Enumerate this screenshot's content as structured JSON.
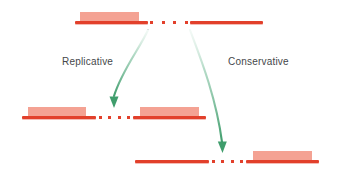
{
  "figure": {
    "colors": {
      "strand": "#e2402b",
      "transposon": "#f4a293",
      "arrow": "#3f9d6c",
      "arrow_fade": "#cfe8db",
      "label_text": "#45474a",
      "background": "#ffffff"
    },
    "labels": {
      "replicative": "Replicative",
      "conservative": "Conservative"
    },
    "rows": [
      {
        "id": "donor",
        "name": "donor-molecule",
        "segments": [
          {
            "kind": "line",
            "x": 75,
            "width": 73,
            "has_transposon": true,
            "transposon_x": 80,
            "transposon_width": 59
          },
          {
            "kind": "dots",
            "x": 150,
            "width": 38,
            "count": 4
          },
          {
            "kind": "line",
            "x": 190,
            "width": 73,
            "has_transposon": false
          }
        ],
        "y": 21
      },
      {
        "id": "replicative-product",
        "name": "replicative-product-molecule",
        "segments": [
          {
            "kind": "line",
            "x": 22,
            "width": 74,
            "has_transposon": true,
            "transposon_x": 28,
            "transposon_width": 58
          },
          {
            "kind": "dots",
            "x": 99,
            "width": 31,
            "count": 4
          },
          {
            "kind": "line",
            "x": 133,
            "width": 73,
            "has_transposon": true,
            "transposon_x": 140,
            "transposon_width": 59
          }
        ],
        "y": 116
      },
      {
        "id": "conservative-product",
        "name": "conservative-product-molecule",
        "segments": [
          {
            "kind": "line",
            "x": 135,
            "width": 74,
            "has_transposon": false
          },
          {
            "kind": "dots",
            "x": 212,
            "width": 31,
            "count": 4
          },
          {
            "kind": "line",
            "x": 246,
            "width": 73,
            "has_transposon": true,
            "transposon_x": 253,
            "transposon_width": 59
          }
        ],
        "y": 160
      }
    ],
    "arrows": [
      {
        "id": "replicative-arrow",
        "name": "replicative-arrow",
        "label": "Replicative"
      },
      {
        "id": "conservative-arrow",
        "name": "conservative-arrow",
        "label": "Conservative"
      }
    ],
    "label_positions": {
      "replicative": {
        "x": 62,
        "y": 56
      },
      "conservative": {
        "x": 228,
        "y": 56
      }
    }
  }
}
